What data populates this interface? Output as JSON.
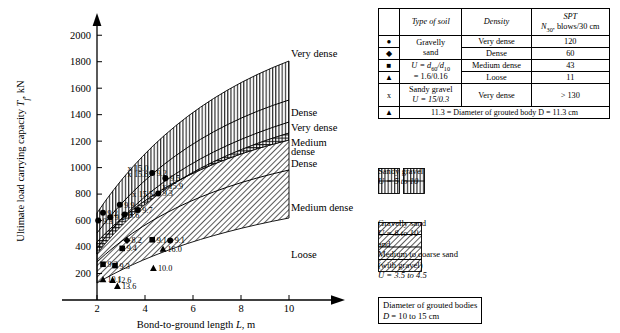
{
  "chart_data": {
    "type": "scatter",
    "title": "",
    "xlabel": "Bond-to-ground length L, m",
    "ylabel": "Ultimate load carrying capacity T_f, kN",
    "xlim": [
      1.2,
      10.6
    ],
    "ylim": [
      0,
      2100
    ],
    "xticks": [
      2,
      4,
      6,
      8,
      10
    ],
    "yticks": [
      200,
      400,
      600,
      800,
      1000,
      1200,
      1400,
      1600,
      1800,
      2000
    ],
    "grid": false,
    "legend_position": "right-of-plot",
    "curve_labels": [
      {
        "text": "Very dense",
        "y": 1860
      },
      {
        "text": "Dense",
        "y": 1420
      },
      {
        "text": "Very dense",
        "y": 1300
      },
      {
        "text": "Medium",
        "y": 1190
      },
      {
        "text": "dense",
        "y": 1125
      },
      {
        "text": "Dense",
        "y": 1030
      },
      {
        "text": "Medium dense",
        "y": 700
      },
      {
        "text": "Loose",
        "y": 345
      }
    ],
    "bands": [
      {
        "name": "Sandy gravel",
        "hatch": "vertical",
        "upper_curve": "very-dense-sg",
        "lower_curve": "dense-sg"
      },
      {
        "name": "Gravelly sand",
        "hatch": "diagonal",
        "upper_curve": "very-dense-gs",
        "lower_curve": "loose-gs"
      }
    ],
    "points": [
      {
        "label": "9.3",
        "x": 2.05,
        "y": 600,
        "symbol": "circle"
      },
      {
        "label": "9.2",
        "x": 2.25,
        "y": 660,
        "symbol": "circle"
      },
      {
        "label": "9.2",
        "x": 2.55,
        "y": 625,
        "symbol": "circle"
      },
      {
        "label": "9.9",
        "x": 2.95,
        "y": 720,
        "symbol": "circle"
      },
      {
        "label": "8.6",
        "x": 3.15,
        "y": 645,
        "symbol": "circle"
      },
      {
        "label": "9.7",
        "x": 3.7,
        "y": 680,
        "symbol": "circle"
      },
      {
        "label": "15.5",
        "x": 3.55,
        "y": 800,
        "symbol": "cross"
      },
      {
        "label": "15.0",
        "x": 3.35,
        "y": 995,
        "symbol": "cross"
      },
      {
        "label": "15.8",
        "x": 3.35,
        "y": 950,
        "symbol": "cross"
      },
      {
        "label": "9.2",
        "x": 4.3,
        "y": 960,
        "symbol": "circle"
      },
      {
        "label": "9.5",
        "x": 4.85,
        "y": 920,
        "symbol": "circle"
      },
      {
        "label": "15.9",
        "x": 4.8,
        "y": 860,
        "symbol": "cross"
      },
      {
        "label": "9.3",
        "x": 4.55,
        "y": 805,
        "symbol": "circle"
      },
      {
        "label": "8.2",
        "x": 3.25,
        "y": 450,
        "symbol": "diamond"
      },
      {
        "label": "9.1",
        "x": 4.3,
        "y": 455,
        "symbol": "square"
      },
      {
        "label": "9.1",
        "x": 5.05,
        "y": 450,
        "symbol": "circle"
      },
      {
        "label": "9.4",
        "x": 3.05,
        "y": 390,
        "symbol": "square"
      },
      {
        "label": "16.0",
        "x": 4.75,
        "y": 385,
        "symbol": "triangle"
      },
      {
        "label": "9.2",
        "x": 2.25,
        "y": 270,
        "symbol": "square"
      },
      {
        "label": "9.3",
        "x": 2.75,
        "y": 260,
        "symbol": "square"
      },
      {
        "label": "10.0",
        "x": 4.35,
        "y": 240,
        "symbol": "triangle"
      },
      {
        "label": "10.1",
        "x": 2.25,
        "y": 155,
        "symbol": "triangle"
      },
      {
        "label": "12.6",
        "x": 2.65,
        "y": 150,
        "symbol": "triangle"
      },
      {
        "label": "13.6",
        "x": 2.85,
        "y": 105,
        "symbol": "triangle"
      }
    ]
  },
  "table": {
    "headers": {
      "symbol": "",
      "type_of_soil": "Type of soil",
      "density": "Density",
      "spt_line1": "SPT",
      "spt_line2_pre": "N",
      "spt_line2_sub": "30",
      "spt_line2_post": ", blows/30 cm"
    },
    "rows": [
      {
        "symbol": "●",
        "symbol_name": "circle-marker",
        "density": "Very dense",
        "spt": "120"
      },
      {
        "symbol": "◆",
        "symbol_name": "diamond-marker",
        "density": "Dense",
        "spt": "60"
      },
      {
        "symbol": "■",
        "symbol_name": "square-marker",
        "density": "Medium dense",
        "spt": "43"
      },
      {
        "symbol": "▲",
        "symbol_name": "triangle-marker",
        "density": "Loose",
        "spt": "11"
      }
    ],
    "gravelly_sand": {
      "line1": "Gravelly",
      "line2": "sand",
      "line3_pre": "U = d",
      "line3_sub1": "60",
      "line3_mid": "/d",
      "line3_sub2": "10",
      "line4": "= 1.6/0.16"
    },
    "sandy_gravel_row": {
      "symbol": "x",
      "symbol_name": "cross-marker",
      "line1": "Sandy gravel",
      "line2": "U = 15/0.3",
      "density": "Very dense",
      "spt": "> 130"
    },
    "footnote": {
      "symbol": "▲",
      "text": "11.3 = Diameter of grouted body D = 11.3 cm"
    }
  },
  "legend": {
    "sandy_gravel": {
      "line1": "Sandy gravel",
      "line2": "U = 5 to 10"
    },
    "gravelly_sand": {
      "line1": "Gravelly sand",
      "line2": "U = 8 to 10",
      "line3": "and",
      "line4": "Medium to coarse sand",
      "line5": "(with gravel)",
      "line6": "U = 3.5 to 4.5"
    },
    "boxed_note": {
      "line1": "Diameter of grouted bodies",
      "line2": "D = 10 to 15 cm"
    }
  }
}
